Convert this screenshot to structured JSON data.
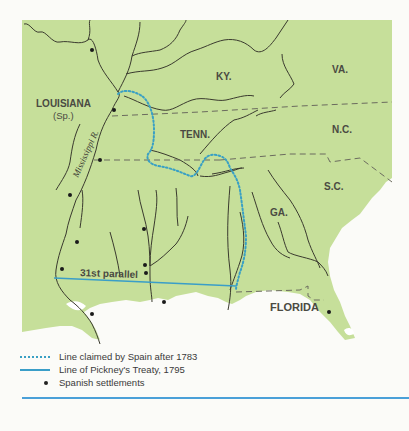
{
  "map": {
    "land_color": "#c6df9a",
    "water_color": "#ffffff",
    "river_color": "#3a3a2e",
    "border_color": "#6b6b5e",
    "spain_claim_color": "#3aa0c4",
    "pickney_line_color": "#3a9ec8",
    "labels": {
      "louisiana": "LOUISIANA",
      "louisiana_sub": "(Sp.)",
      "mississippi": "Mississippi R.",
      "ky": "KY.",
      "va": "VA.",
      "tenn": "TENN.",
      "nc": "N.C.",
      "sc": "S.C.",
      "ga": "GA.",
      "florida": "FLORIDA",
      "parallel": "31st parallel"
    }
  },
  "legend": {
    "items": [
      {
        "symbol": "dotted-line",
        "label": "Line claimed by Spain after 1783"
      },
      {
        "symbol": "solid-line",
        "label": "Line of Pickney's Treaty, 1795"
      },
      {
        "symbol": "dot",
        "label": "Spanish settlements"
      }
    ]
  }
}
